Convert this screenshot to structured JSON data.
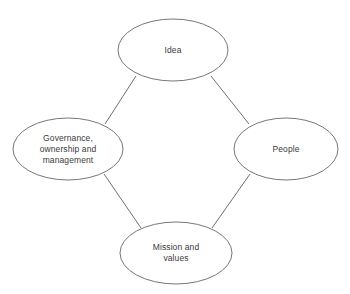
{
  "diagram": {
    "type": "cycle-diagram",
    "background_color": "#ffffff",
    "node_stroke_color": "#777777",
    "connector_color": "#6f6f6f",
    "text_color": "#3a3a3a",
    "nodes": [
      {
        "id": "idea",
        "name": "Idea",
        "lines": [
          "Idea"
        ],
        "position": "top",
        "cx": 173,
        "cy": 50,
        "rx": 55,
        "ry": 31
      },
      {
        "id": "governance",
        "name": "Governance, ownership and management",
        "lines": [
          "Governance,",
          "ownership and",
          "management"
        ],
        "position": "left",
        "cx": 68,
        "cy": 149,
        "rx": 55,
        "ry": 31
      },
      {
        "id": "people",
        "name": "People",
        "lines": [
          "People"
        ],
        "position": "right",
        "cx": 286,
        "cy": 149,
        "rx": 52,
        "ry": 31
      },
      {
        "id": "mission",
        "name": "Mission and values",
        "lines": [
          "Mission and",
          "values"
        ],
        "position": "bottom",
        "cx": 176,
        "cy": 253,
        "rx": 56,
        "ry": 31
      }
    ],
    "connectors": [
      {
        "id": "idea-governance",
        "from": "idea",
        "to": "governance",
        "x1": 136,
        "y1": 76,
        "x2": 105,
        "y2": 124
      },
      {
        "id": "idea-people",
        "from": "idea",
        "to": "people",
        "x1": 211,
        "y1": 76,
        "x2": 249,
        "y2": 124
      },
      {
        "id": "governance-mission",
        "from": "governance",
        "to": "mission",
        "x1": 104,
        "y1": 174,
        "x2": 141,
        "y2": 228
      },
      {
        "id": "people-mission",
        "from": "people",
        "to": "mission",
        "x1": 250,
        "y1": 174,
        "x2": 212,
        "y2": 228
      }
    ]
  }
}
